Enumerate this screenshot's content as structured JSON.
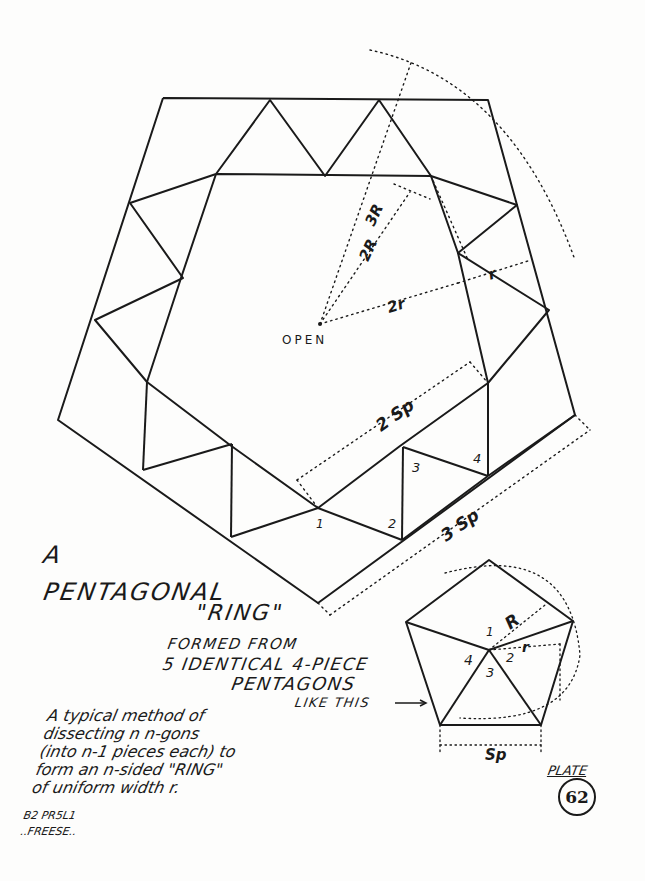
{
  "plate": {
    "word": "PLATE",
    "number": "62"
  },
  "title": {
    "line1": "A",
    "line2": "PENTAGONAL",
    "line3": "\"RING\""
  },
  "formed_from": {
    "line1": "FORMED FROM",
    "line2": "5 IDENTICAL 4-PIECE",
    "line3": "PENTAGONS",
    "line4": "LIKE THIS"
  },
  "description": {
    "lines": [
      "A typical method of",
      "dissecting n n-gons",
      "(into n-1 pieces each) to",
      "form an n-sided \"RING\"",
      "of uniform width r."
    ]
  },
  "credit": {
    "line1": "B2 PR5L1",
    "line2": "..FREESE.."
  },
  "ring_diagram": {
    "center_label": "OPEN",
    "labels": {
      "three_R": "3R",
      "two_R": "2R",
      "two_r": "2r",
      "r": "r",
      "two_Sp": "2 Sp",
      "three_Sp": "3 Sp"
    },
    "piece_numbers": [
      "1",
      "2",
      "3",
      "4"
    ]
  },
  "small_pentagon": {
    "labels": {
      "R": "R",
      "r": "r",
      "Sp": "Sp"
    },
    "piece_numbers": [
      "1",
      "2",
      "3",
      "4"
    ]
  }
}
